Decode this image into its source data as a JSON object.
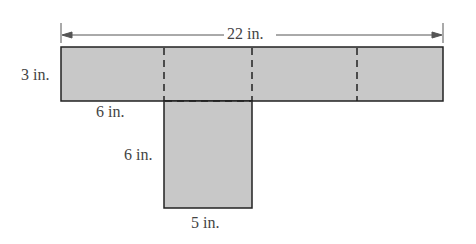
{
  "diagram": {
    "type": "net",
    "shape": "T-shaped net of a rectangular box",
    "fill_color": "#c8c8c8",
    "stroke_color": "#222222",
    "labels": {
      "total_width": "22 in.",
      "top_height": "3 in.",
      "top_segment": "6 in.",
      "tab_height": "6 in.",
      "tab_width": "5 in."
    }
  }
}
